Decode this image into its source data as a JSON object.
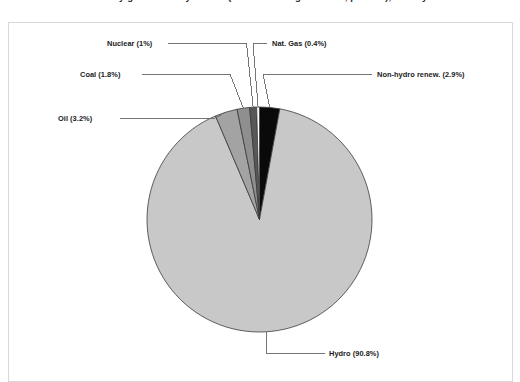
{
  "figure": {
    "title": "Electricity generation by source (share of total generation, percent), latest year",
    "background_color": "#ffffff",
    "border_color": "#d8d8da"
  },
  "chart_data": {
    "type": "pie",
    "title": "Electricity generation by source (share of total generation, percent), latest year",
    "xlabel": "",
    "ylabel": "",
    "legend_position": "none",
    "labels_style": "leader-line callouts",
    "units": "percent",
    "total": 100.1,
    "categories": [
      "Non-hydro renew.",
      "Hydro",
      "Oil",
      "Coal",
      "Nuclear",
      "Nat. Gas"
    ],
    "values": [
      2.9,
      90.8,
      3.2,
      1.8,
      1.0,
      0.4
    ],
    "colors": [
      "#0a0a0a",
      "#c8c8c8",
      "#a3a3a3",
      "#8f8f8f",
      "#585858",
      "#ffffff"
    ],
    "slices": [
      {
        "name": "Non-hydro renew.",
        "label": "Non-hydro renew. (2.9%)",
        "value": 2.9,
        "color": "#0a0a0a",
        "label_side": "right"
      },
      {
        "name": "Hydro",
        "label": "Hydro (90.8%)",
        "value": 90.8,
        "color": "#c8c8c8",
        "label_side": "bottom"
      },
      {
        "name": "Oil",
        "label": "Oil (3.2%)",
        "value": 3.2,
        "color": "#a3a3a3",
        "label_side": "left"
      },
      {
        "name": "Coal",
        "label": "Coal (1.8%)",
        "value": 1.8,
        "color": "#8f8f8f",
        "label_side": "left"
      },
      {
        "name": "Nuclear",
        "label": "Nuclear (1%)",
        "value": 1.0,
        "color": "#585858",
        "label_side": "left"
      },
      {
        "name": "Nat. Gas",
        "label": "Nat. Gas (0.4%)",
        "value": 0.4,
        "color": "#ffffff",
        "label_side": "right"
      }
    ]
  }
}
